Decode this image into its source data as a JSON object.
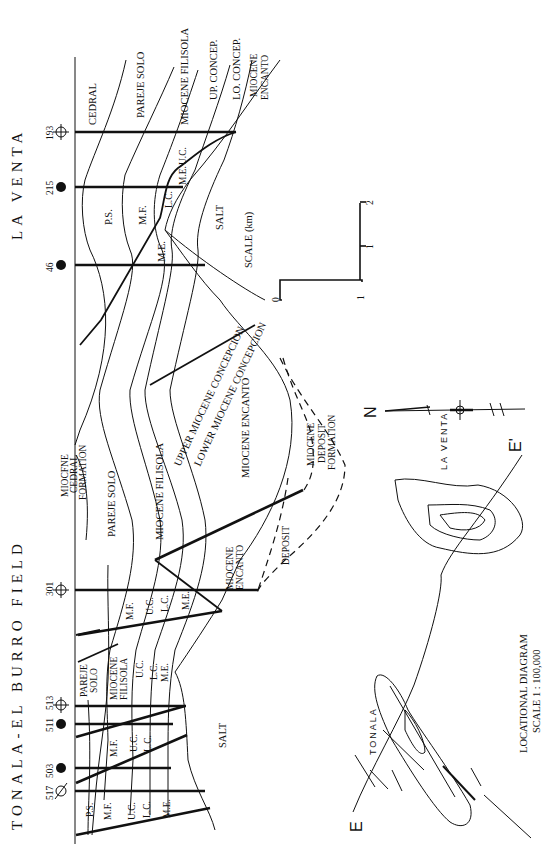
{
  "titles": {
    "la_venta": "LA VENTA",
    "tonala": "TONALA-EL BURRO FIELD"
  },
  "wells": [
    {
      "id": "193",
      "type": "abandoned"
    },
    {
      "id": "215",
      "type": "oil"
    },
    {
      "id": "46",
      "type": "oil"
    },
    {
      "id": "301",
      "type": "abandoned"
    },
    {
      "id": "513",
      "type": "abandoned"
    },
    {
      "id": "511",
      "type": "oil"
    },
    {
      "id": "503",
      "type": "oil"
    },
    {
      "id": "517",
      "type": "dry"
    }
  ],
  "la_venta_labels": {
    "cedral": "CEDRAL",
    "pareje_solo": "PAREJE SOLO",
    "miocene_filisola": "MIOCENE FILISOLA",
    "up_concep": "UP. CONCEP.",
    "lo_concep": "LO. CONCEP.",
    "miocene_encanto_1": "MIOCENE",
    "miocene_encanto_2": "ENCANTO",
    "ps": "P.S.",
    "mf": "M.F.",
    "me": "M.E.",
    "lc": "L.C.",
    "uc": "U.C.",
    "me2": "M.E.",
    "salt": "SALT"
  },
  "middle_labels": {
    "cedral_1": "MIOCFNE",
    "cedral_2": "CEDRAL",
    "cedral_3": "FORMATION",
    "pareje_solo": "PAREJE SOLO",
    "miocene_filisola": "MIOCENE FILISOLA",
    "upper_concepcion": "UPPER MIOCENE CONCEPCION",
    "lower_concepcion": "LOWER MIOCENE CONCEPCION",
    "miocene_encanto": "MIOCENE ENCANTO",
    "upper_concepcion_fault": "MIOCENE CONCEPCION",
    "deposit_1": "MIOCENE",
    "deposit_2": "DEPOSIT",
    "deposit_3": "FORMATION",
    "deposit": "DEPOSIT",
    "encanto_1": "MIOCENE",
    "encanto_2": "ENCANTO"
  },
  "tonala_labels": {
    "mf_a": "M.F.",
    "uc_a": "U.C.",
    "lc_a": "L.C.",
    "me_a": "M.E.",
    "pareje_1": "PAREJE",
    "pareje_2": "SOLO",
    "filisola_1": "MIOCENE",
    "filisola_2": "FILISOLA",
    "uc_b": "U.C.",
    "lc_b": "L.C.",
    "me_b": "M.E.",
    "mf_c": "M.F.",
    "uc_c": "U.C.",
    "lc_c": "L.C.",
    "ps_d": "P.S.",
    "mf_d": "M.F.",
    "uc_d": "U.C.",
    "lc_d": "L.C.",
    "me_d": "M.E.",
    "salt": "SALT"
  },
  "scale": {
    "label": "SCALE (km)",
    "ticks": [
      "0",
      "1",
      "2"
    ],
    "side_tick": "1"
  },
  "location_map": {
    "north": "N",
    "e_start": "E",
    "e_end": "E'",
    "la_venta": "LA VENTA",
    "tonala": "TONALA",
    "caption": "LOCATIONAL DIAGRAM",
    "scale": "SCALE  1 : 100,000"
  }
}
